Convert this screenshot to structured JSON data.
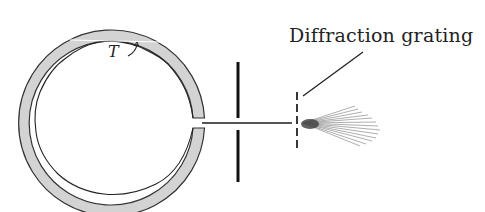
{
  "diagram": {
    "labels": {
      "grating": "Diffraction grating",
      "temperature": "T"
    },
    "components": [
      "cavity-ring",
      "aperture-slit",
      "beam",
      "diffraction-grating",
      "diffracted-fan"
    ],
    "colors": {
      "ring_fill": "#d3d3d3",
      "ink": "#222222",
      "fan": "#555555"
    }
  }
}
